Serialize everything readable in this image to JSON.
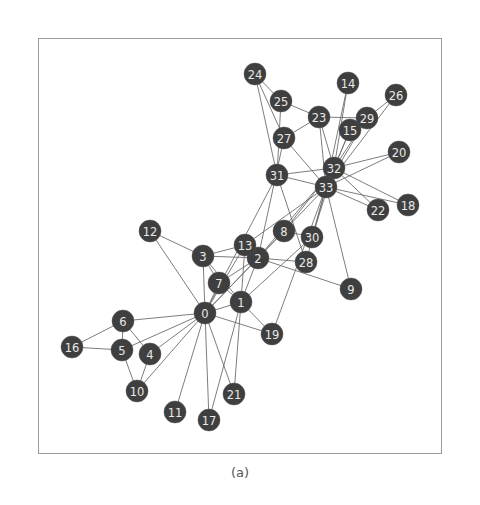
{
  "figure": {
    "caption": "(a)",
    "colors": {
      "node": "#3f3f3f",
      "label": "#e8e8e8",
      "edge": "#6e6e6e",
      "frame": "#9a9a9a"
    }
  },
  "chart_data": {
    "type": "network",
    "title": "",
    "caption": "(a)",
    "node_radius": 11,
    "nodes": [
      {
        "id": 0,
        "x": 205,
        "y": 313
      },
      {
        "id": 1,
        "x": 241,
        "y": 302
      },
      {
        "id": 2,
        "x": 258,
        "y": 258
      },
      {
        "id": 3,
        "x": 203,
        "y": 256
      },
      {
        "id": 4,
        "x": 150,
        "y": 354
      },
      {
        "id": 5,
        "x": 122,
        "y": 350
      },
      {
        "id": 6,
        "x": 123,
        "y": 321
      },
      {
        "id": 7,
        "x": 219,
        "y": 283
      },
      {
        "id": 8,
        "x": 284,
        "y": 231
      },
      {
        "id": 9,
        "x": 351,
        "y": 289
      },
      {
        "id": 10,
        "x": 137,
        "y": 391
      },
      {
        "id": 11,
        "x": 175,
        "y": 412
      },
      {
        "id": 12,
        "x": 150,
        "y": 231
      },
      {
        "id": 13,
        "x": 245,
        "y": 245
      },
      {
        "id": 14,
        "x": 348,
        "y": 83
      },
      {
        "id": 15,
        "x": 350,
        "y": 130
      },
      {
        "id": 16,
        "x": 72,
        "y": 347
      },
      {
        "id": 17,
        "x": 209,
        "y": 420
      },
      {
        "id": 18,
        "x": 408,
        "y": 205
      },
      {
        "id": 19,
        "x": 272,
        "y": 334
      },
      {
        "id": 20,
        "x": 399,
        "y": 152
      },
      {
        "id": 21,
        "x": 234,
        "y": 394
      },
      {
        "id": 22,
        "x": 378,
        "y": 210
      },
      {
        "id": 23,
        "x": 319,
        "y": 117
      },
      {
        "id": 24,
        "x": 255,
        "y": 74
      },
      {
        "id": 25,
        "x": 281,
        "y": 101
      },
      {
        "id": 26,
        "x": 396,
        "y": 95
      },
      {
        "id": 27,
        "x": 284,
        "y": 138
      },
      {
        "id": 28,
        "x": 306,
        "y": 262
      },
      {
        "id": 29,
        "x": 367,
        "y": 118
      },
      {
        "id": 30,
        "x": 312,
        "y": 237
      },
      {
        "id": 31,
        "x": 277,
        "y": 175
      },
      {
        "id": 32,
        "x": 334,
        "y": 168
      },
      {
        "id": 33,
        "x": 326,
        "y": 187
      }
    ],
    "edges": [
      [
        0,
        1
      ],
      [
        0,
        2
      ],
      [
        0,
        3
      ],
      [
        0,
        4
      ],
      [
        0,
        5
      ],
      [
        0,
        6
      ],
      [
        0,
        7
      ],
      [
        0,
        8
      ],
      [
        0,
        10
      ],
      [
        0,
        11
      ],
      [
        0,
        12
      ],
      [
        0,
        13
      ],
      [
        0,
        17
      ],
      [
        0,
        19
      ],
      [
        0,
        21
      ],
      [
        0,
        31
      ],
      [
        1,
        2
      ],
      [
        1,
        3
      ],
      [
        1,
        7
      ],
      [
        1,
        13
      ],
      [
        1,
        17
      ],
      [
        1,
        19
      ],
      [
        1,
        21
      ],
      [
        1,
        30
      ],
      [
        2,
        3
      ],
      [
        2,
        7
      ],
      [
        2,
        8
      ],
      [
        2,
        9
      ],
      [
        2,
        13
      ],
      [
        2,
        27
      ],
      [
        2,
        28
      ],
      [
        2,
        32
      ],
      [
        3,
        7
      ],
      [
        3,
        12
      ],
      [
        3,
        13
      ],
      [
        4,
        6
      ],
      [
        4,
        10
      ],
      [
        5,
        6
      ],
      [
        5,
        10
      ],
      [
        5,
        16
      ],
      [
        6,
        16
      ],
      [
        8,
        30
      ],
      [
        8,
        32
      ],
      [
        8,
        33
      ],
      [
        9,
        33
      ],
      [
        13,
        33
      ],
      [
        14,
        32
      ],
      [
        14,
        33
      ],
      [
        15,
        32
      ],
      [
        15,
        33
      ],
      [
        18,
        32
      ],
      [
        18,
        33
      ],
      [
        19,
        33
      ],
      [
        20,
        32
      ],
      [
        20,
        33
      ],
      [
        22,
        32
      ],
      [
        22,
        33
      ],
      [
        23,
        25
      ],
      [
        23,
        27
      ],
      [
        23,
        29
      ],
      [
        23,
        32
      ],
      [
        23,
        33
      ],
      [
        24,
        25
      ],
      [
        24,
        27
      ],
      [
        24,
        31
      ],
      [
        25,
        31
      ],
      [
        26,
        29
      ],
      [
        26,
        33
      ],
      [
        27,
        33
      ],
      [
        28,
        31
      ],
      [
        28,
        33
      ],
      [
        29,
        32
      ],
      [
        29,
        33
      ],
      [
        30,
        32
      ],
      [
        30,
        33
      ],
      [
        31,
        32
      ],
      [
        31,
        33
      ],
      [
        32,
        33
      ]
    ]
  }
}
